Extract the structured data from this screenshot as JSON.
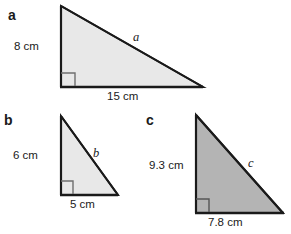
{
  "figure": {
    "background_color": "#ffffff",
    "stroke_color": "#1a1a1a",
    "light_fill": "#e8e8e8",
    "dark_fill": "#b4b4b4"
  },
  "triangles": [
    {
      "part": "a",
      "fill": "#e8e8e8",
      "vertical_label": "8 cm",
      "horizontal_label": "15 cm",
      "hypotenuse_label": "a",
      "right_angle_marker": "right-angle-square",
      "apex": {
        "x": 61,
        "y": 6
      },
      "right_angle_vertex": {
        "x": 61,
        "y": 87
      },
      "base_end": {
        "x": 203,
        "y": 87
      }
    },
    {
      "part": "b",
      "fill": "#e8e8e8",
      "vertical_label": "6 cm",
      "horizontal_label": "5 cm",
      "hypotenuse_label": "b",
      "right_angle_marker": "right-angle-square",
      "apex": {
        "x": 61,
        "y": 116
      },
      "right_angle_vertex": {
        "x": 61,
        "y": 195
      },
      "base_end": {
        "x": 118,
        "y": 195
      }
    },
    {
      "part": "c",
      "fill": "#b4b4b4",
      "vertical_label": "9.3 cm",
      "horizontal_label": "7.8 cm",
      "hypotenuse_label": "c",
      "right_angle_marker": "right-angle-square",
      "apex": {
        "x": 196,
        "y": 115
      },
      "right_angle_vertex": {
        "x": 196,
        "y": 213
      },
      "base_end": {
        "x": 283,
        "y": 213
      }
    }
  ]
}
